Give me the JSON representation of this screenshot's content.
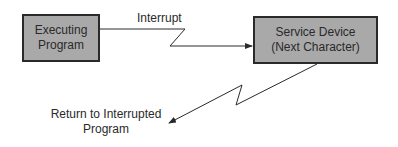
{
  "diagram": {
    "nodes": [
      {
        "id": "executing",
        "line1": "Executing",
        "line2": "Program"
      },
      {
        "id": "service",
        "line1": "Service Device",
        "line2": "(Next Character)"
      }
    ],
    "edges": {
      "interrupt_label": "Interrupt",
      "return_line1": "Return to Interrupted",
      "return_line2": "Program"
    },
    "colors": {
      "box_fill": "#a9a9a9",
      "stroke": "#2a2a2a"
    }
  }
}
